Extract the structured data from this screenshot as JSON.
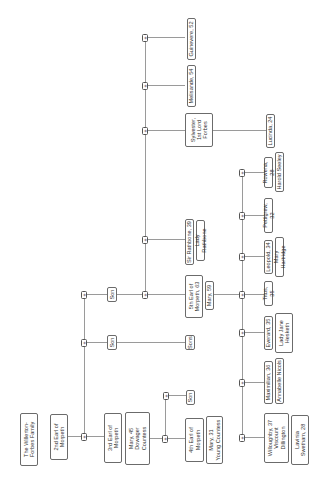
{
  "expand_glyph": "+",
  "nodes": {
    "title": "The Willerton-\nForbes Family",
    "earl2": "2nd Earl of\nMorpeth",
    "earl3": "3rd Earl of\nMorpeth",
    "mary45": "Mary, 45\nDowager\nCountess",
    "son_a": "Son",
    "earl4": "4th Earl of\nMorpeth",
    "mary31": "Mary, 31\nYoung Countess",
    "son_b": "Son",
    "sons": "Sons",
    "son_c": "Son",
    "earl5": "5th Earl of\nMorpeth, 63",
    "mary59": "Mary, 59",
    "sir_rathbone": "Sir Rathbone, 39",
    "lady_rathbone": "Lady Rathbone",
    "sylvester": "Sylvester,\n1st Lord\nForbes",
    "lucinda": "Lucinda, 24",
    "melisande": "Melisande, 54",
    "guinevere": "Guinevere, 52",
    "willoughby": "Willoughby, 37\nViscount\nDillington",
    "lavinia": "Lavinia\nSwetham, 28",
    "maximilian": "Maximilian, 36",
    "annabelle": "Annabelle Nicols",
    "everard": "Everard, 35",
    "lady_jane": "Lady Jane\nHesketh",
    "titus": "Titus, 35",
    "leopold": "Leopold, 34",
    "mary_hartridge": "Mary Hartridge",
    "pettigrew": "Pettigrew, 32",
    "rowena": "Rowena, 28",
    "harold": "Harold Seeley"
  }
}
